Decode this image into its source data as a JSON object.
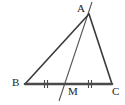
{
  "figure": {
    "name": "triangle-median-diagram",
    "background_color": "#ffffff",
    "stroke_color": "#3a3a3a",
    "base_stroke_color": "#4a4a4a",
    "cevian_stroke_color": "#555555",
    "label_color": "#1d1d1d",
    "canvas": {
      "width": 125,
      "height": 105
    }
  },
  "points": {
    "A": {
      "label": "A",
      "x": 89,
      "y": 14,
      "label_x": 77,
      "label_y": 3
    },
    "B": {
      "label": "B",
      "x": 25,
      "y": 84,
      "label_x": 12,
      "label_y": 77
    },
    "C": {
      "label": "C",
      "x": 112,
      "y": 84,
      "label_x": 112,
      "label_y": 86
    },
    "M": {
      "label": "M",
      "x": 67,
      "y": 84,
      "label_x": 68,
      "label_y": 86
    }
  },
  "segments": [
    {
      "name": "side-ab",
      "from": "A",
      "to": "B",
      "x1": 89,
      "y1": 14,
      "x2": 25,
      "y2": 84,
      "width": 1.6
    },
    {
      "name": "side-ac",
      "from": "A",
      "to": "C",
      "x1": 89,
      "y1": 14,
      "x2": 112,
      "y2": 84,
      "width": 1.6
    },
    {
      "name": "side-bc",
      "from": "B",
      "to": "C",
      "x1": 25,
      "y1": 84,
      "x2": 112,
      "y2": 84,
      "width": 2.6
    },
    {
      "name": "cevian-am-extended",
      "from": "A",
      "to": "M",
      "x1": 92,
      "y1": 2,
      "x2": 59,
      "y2": 101,
      "width": 1.1
    }
  ],
  "tick_marks": [
    {
      "name": "tick-segment-bm",
      "segment": "BM",
      "count": 2,
      "cx": 46,
      "cy": 84,
      "height": 8,
      "gap": 3
    },
    {
      "name": "tick-segment-mc",
      "segment": "MC",
      "count": 2,
      "cx": 90,
      "cy": 84,
      "height": 8,
      "gap": 3
    }
  ],
  "annotations": {
    "equal_segments": "BM = MC",
    "tick_meaning": "double tick marks denote congruent segments"
  }
}
